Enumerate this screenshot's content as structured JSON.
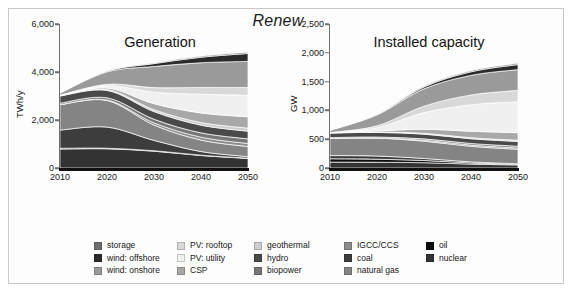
{
  "figure": {
    "title": "Renew",
    "background_color": "#ffffff",
    "frame_color": "#c9c9c9"
  },
  "panels": [
    {
      "id": "generation",
      "title": "Generation",
      "ylabel": "TWh/y",
      "yticks": [
        "0",
        "2,000",
        "4,000",
        "6,000"
      ],
      "ytick_values": [
        0,
        2000,
        4000,
        6000
      ],
      "xticks": [
        "2010",
        "2020",
        "2030",
        "2040",
        "2050"
      ],
      "ylim": [
        0,
        6000
      ],
      "xlim": [
        2010,
        2050
      ]
    },
    {
      "id": "capacity",
      "title": "Installed capacity",
      "ylabel": "GW",
      "yticks": [
        "0",
        "500",
        "1,000",
        "1,500",
        "2,000",
        "2,500"
      ],
      "ytick_values": [
        0,
        500,
        1000,
        1500,
        2000,
        2500
      ],
      "xticks": [
        "2010",
        "2020",
        "2030",
        "2040",
        "2050"
      ],
      "ylim": [
        0,
        2500
      ],
      "xlim": [
        2010,
        2050
      ]
    }
  ],
  "legend": {
    "columns": [
      [
        {
          "label": "storage",
          "color": "#6e6e6e"
        },
        {
          "label": "wind: offshore",
          "color": "#2b2b2b"
        },
        {
          "label": "wind: onshore",
          "color": "#9a9a9a"
        }
      ],
      [
        {
          "label": "PV: rooftop",
          "color": "#d8d8d8"
        },
        {
          "label": "PV: utility",
          "color": "#f0f0f0"
        },
        {
          "label": "CSP",
          "color": "#a8a8a8"
        }
      ],
      [
        {
          "label": "geothermal",
          "color": "#cdcdcd"
        },
        {
          "label": "hydro",
          "color": "#4a4a4a"
        },
        {
          "label": "biopower",
          "color": "#777777"
        }
      ],
      [
        {
          "label": "IGCC/CCS",
          "color": "#8c8c8c"
        },
        {
          "label": "coal",
          "color": "#3d3d3d"
        },
        {
          "label": "natural gas",
          "color": "#848484"
        }
      ],
      [
        {
          "label": "oil",
          "color": "#0d0d0d"
        },
        {
          "label": "nuclear",
          "color": "#333333"
        }
      ]
    ]
  },
  "chart_data": [
    {
      "type": "area",
      "id": "generation",
      "title": "Generation",
      "xlabel": "",
      "ylabel": "TWh/y",
      "x": [
        2010,
        2020,
        2030,
        2040,
        2050
      ],
      "xlim": [
        2010,
        2050
      ],
      "ylim": [
        0,
        6000
      ],
      "grid": false,
      "legend_position": "bottom",
      "stack_order_bottom_to_top": [
        "nuclear",
        "oil",
        "coal",
        "natural gas",
        "IGCC/CCS",
        "biopower",
        "hydro",
        "geothermal",
        "CSP",
        "PV: utility",
        "PV: rooftop",
        "wind: onshore",
        "wind: offshore",
        "storage"
      ],
      "series": [
        {
          "name": "nuclear",
          "color": "#333333",
          "values": [
            790,
            800,
            700,
            520,
            400
          ]
        },
        {
          "name": "oil",
          "color": "#0d0d0d",
          "values": [
            30,
            25,
            20,
            15,
            12
          ]
        },
        {
          "name": "coal",
          "color": "#3d3d3d",
          "values": [
            760,
            880,
            430,
            150,
            60
          ]
        },
        {
          "name": "natural gas",
          "color": "#848484",
          "values": [
            1060,
            1110,
            640,
            480,
            420
          ]
        },
        {
          "name": "IGCC/CCS",
          "color": "#8c8c8c",
          "values": [
            0,
            20,
            90,
            120,
            130
          ]
        },
        {
          "name": "biopower",
          "color": "#777777",
          "values": [
            60,
            90,
            150,
            180,
            190
          ]
        },
        {
          "name": "hydro",
          "color": "#4a4a4a",
          "values": [
            300,
            310,
            320,
            320,
            320
          ]
        },
        {
          "name": "geothermal",
          "color": "#cdcdcd",
          "values": [
            20,
            40,
            80,
            110,
            130
          ]
        },
        {
          "name": "CSP",
          "color": "#a8a8a8",
          "values": [
            5,
            60,
            250,
            400,
            470
          ]
        },
        {
          "name": "PV: utility",
          "color": "#f0f0f0",
          "values": [
            5,
            90,
            480,
            780,
            900
          ]
        },
        {
          "name": "PV: rooftop",
          "color": "#d8d8d8",
          "values": [
            5,
            60,
            190,
            280,
            320
          ]
        },
        {
          "name": "wind: onshore",
          "color": "#9a9a9a",
          "values": [
            95,
            520,
            880,
            1030,
            1090
          ]
        },
        {
          "name": "wind: offshore",
          "color": "#2b2b2b",
          "values": [
            0,
            30,
            120,
            230,
            330
          ]
        },
        {
          "name": "storage",
          "color": "#6e6e6e",
          "values": [
            0,
            10,
            30,
            40,
            50
          ]
        }
      ],
      "totals": [
        3130,
        4045,
        4380,
        4655,
        4822
      ]
    },
    {
      "type": "area",
      "id": "capacity",
      "title": "Installed capacity",
      "xlabel": "",
      "ylabel": "GW",
      "x": [
        2010,
        2020,
        2030,
        2040,
        2050
      ],
      "xlim": [
        2010,
        2050
      ],
      "ylim": [
        0,
        2500
      ],
      "grid": false,
      "legend_position": "bottom",
      "stack_order_bottom_to_top": [
        "nuclear",
        "oil",
        "coal",
        "natural gas",
        "IGCC/CCS",
        "biopower",
        "hydro",
        "geothermal",
        "CSP",
        "PV: utility",
        "PV: rooftop",
        "wind: onshore",
        "wind: offshore",
        "storage"
      ],
      "series": [
        {
          "name": "nuclear",
          "color": "#333333",
          "values": [
            102,
            100,
            92,
            68,
            52
          ]
        },
        {
          "name": "oil",
          "color": "#0d0d0d",
          "values": [
            58,
            52,
            38,
            20,
            12
          ]
        },
        {
          "name": "coal",
          "color": "#3d3d3d",
          "values": [
            56,
            56,
            36,
            18,
            10
          ]
        },
        {
          "name": "natural gas",
          "color": "#848484",
          "values": [
            300,
            310,
            300,
            270,
            250
          ]
        },
        {
          "name": "IGCC/CCS",
          "color": "#8c8c8c",
          "values": [
            0,
            4,
            16,
            22,
            24
          ]
        },
        {
          "name": "biopower",
          "color": "#777777",
          "values": [
            12,
            16,
            24,
            28,
            30
          ]
        },
        {
          "name": "hydro",
          "color": "#4a4a4a",
          "values": [
            78,
            80,
            82,
            82,
            82
          ]
        },
        {
          "name": "geothermal",
          "color": "#cdcdcd",
          "values": [
            4,
            8,
            14,
            18,
            22
          ]
        },
        {
          "name": "CSP",
          "color": "#a8a8a8",
          "values": [
            2,
            18,
            70,
            112,
            130
          ]
        },
        {
          "name": "PV: utility",
          "color": "#f0f0f0",
          "values": [
            2,
            54,
            290,
            460,
            540
          ]
        },
        {
          "name": "PV: rooftop",
          "color": "#d8d8d8",
          "values": [
            2,
            34,
            112,
            170,
            196
          ]
        },
        {
          "name": "wind: onshore",
          "color": "#9a9a9a",
          "values": [
            40,
            190,
            300,
            340,
            360
          ]
        },
        {
          "name": "wind: offshore",
          "color": "#2b2b2b",
          "values": [
            0,
            8,
            32,
            62,
            88
          ]
        },
        {
          "name": "storage",
          "color": "#6e6e6e",
          "values": [
            0,
            4,
            12,
            18,
            22
          ]
        }
      ],
      "totals": [
        656,
        934,
        1418,
        1688,
        1818
      ]
    }
  ]
}
